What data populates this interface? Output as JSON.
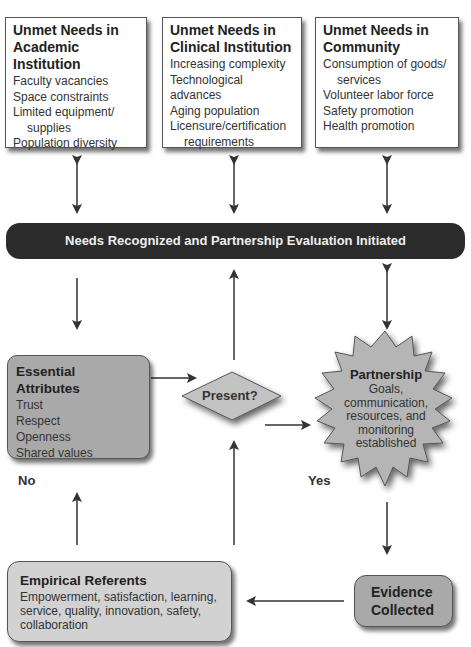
{
  "top_boxes": [
    {
      "title_line1": "Unmet Needs in",
      "title_line2": "Academic Institution",
      "items": [
        "Faculty vacancies",
        "Space constraints",
        "Limited equipment/",
        "supplies",
        "Population diversity"
      ]
    },
    {
      "title_line1": "Unmet Needs in",
      "title_line2": "Clinical Institution",
      "items": [
        "Increasing complexity",
        "Technological advances",
        "Aging population",
        "Licensure/certification",
        "requirements"
      ]
    },
    {
      "title_line1": "Unmet Needs in",
      "title_line2": "Community",
      "items": [
        "Consumption of goods/",
        "services",
        "Volunteer labor force",
        "Safety promotion",
        "Health promotion"
      ]
    }
  ],
  "bar": {
    "label": "Needs Recognized and Partnership Evaluation Initiated"
  },
  "essential_attributes": {
    "title": "Essential Attributes",
    "items": [
      "Trust",
      "Respect",
      "Openness",
      "Shared values"
    ]
  },
  "decision": {
    "label": "Present?"
  },
  "partnership": {
    "title": "Partnership",
    "lines": [
      "Goals,",
      "communication,",
      "resources, and",
      "monitoring",
      "established"
    ]
  },
  "labels": {
    "no": "No",
    "yes": "Yes"
  },
  "empirical_referents": {
    "title": "Empirical Referents",
    "lines": [
      "Empowerment, satisfaction, learning,",
      "service, quality, innovation, safety,",
      "collaboration"
    ]
  },
  "evidence": {
    "line1": "Evidence",
    "line2": "Collected"
  },
  "colors": {
    "bar": "#2b2b2b",
    "gray_box": "#a9a9a9",
    "light_box": "#d2d2d2",
    "shape_fill": "#b5b5b5",
    "arrow": "#333333"
  }
}
